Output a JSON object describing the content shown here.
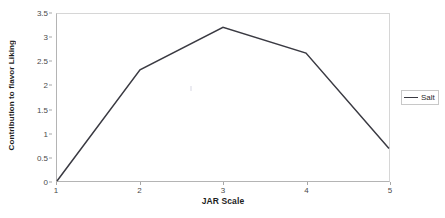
{
  "chart_data": {
    "type": "line",
    "title": "",
    "xlabel": "JAR Scale",
    "ylabel": "Contribution to flavor Liking",
    "x": [
      1,
      2,
      3,
      4,
      5
    ],
    "xtick_labels": [
      "1",
      "2",
      "3",
      "4",
      "5"
    ],
    "ytick_labels": [
      "0",
      "0.5",
      "1",
      "1.5",
      "2",
      "2.5",
      "3",
      "3.5"
    ],
    "ytick_values": [
      0,
      0.5,
      1,
      1.5,
      2,
      2.5,
      3,
      3.5
    ],
    "xlim": [
      1,
      5
    ],
    "ylim": [
      0,
      3.5
    ],
    "grid": false,
    "legend_position": "right",
    "series": [
      {
        "name": "Salt",
        "color": "#3a3a42",
        "values": [
          0,
          2.33,
          3.22,
          2.68,
          0.68
        ]
      }
    ]
  },
  "legend": {
    "entries": [
      {
        "label": "Salt"
      }
    ]
  },
  "axes": {
    "x_title": "JAR Scale",
    "y_title": "Contribution to flavor Liking"
  }
}
